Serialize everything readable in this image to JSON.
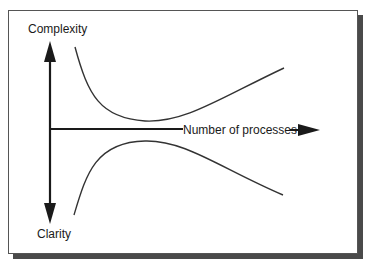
{
  "diagram": {
    "labels": {
      "top_axis": "Complexity",
      "bottom_axis": "Clarity",
      "horizontal_axis": "Number of processes"
    },
    "colors": {
      "stroke": "#1a1a1a",
      "curve": "#333333",
      "frame_border": "#555555",
      "shadow": "#4a4a4a",
      "background": "#ffffff"
    },
    "curves": [
      {
        "name": "complexity-curve",
        "path": "M75,47 C88,95 100,118 145,121 C185,123 220,98 284,68"
      },
      {
        "name": "clarity-curve",
        "path": "M74,215 C86,175 95,142 145,141 C185,140 220,168 283,195"
      }
    ]
  }
}
